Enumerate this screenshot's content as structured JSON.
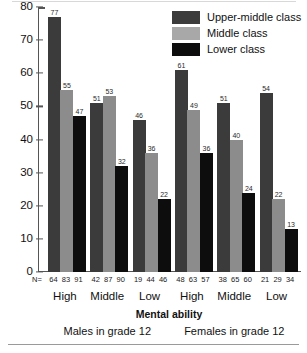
{
  "chart_data": {
    "type": "bar",
    "title": "",
    "xlabel": "Mental ability",
    "ylabel": "",
    "ylim": [
      0,
      80
    ],
    "yticks": [
      0,
      10,
      20,
      30,
      40,
      50,
      60,
      70,
      80
    ],
    "grid": false,
    "legend_position": "top-right",
    "categories": [
      "High",
      "Middle",
      "Low",
      "High",
      "Middle",
      "Low"
    ],
    "panels": [
      "Males in grade 12",
      "Females in grade 12"
    ],
    "n_prefix": "N=",
    "series": [
      {
        "name": "Upper-middle class",
        "color": "#3b3b3b",
        "values": [
          77,
          51,
          46,
          61,
          51,
          54
        ]
      },
      {
        "name": "Middle class",
        "color": "#8c8c8c",
        "values": [
          55,
          53,
          36,
          49,
          40,
          22
        ]
      },
      {
        "name": "Lower class",
        "color": "#0d0d0d",
        "values": [
          47,
          32,
          22,
          36,
          24,
          13
        ]
      }
    ],
    "n_values": [
      [
        64,
        83,
        91
      ],
      [
        42,
        87,
        90
      ],
      [
        19,
        44,
        46
      ],
      [
        48,
        63,
        57
      ],
      [
        38,
        65,
        60
      ],
      [
        21,
        29,
        34
      ]
    ]
  }
}
